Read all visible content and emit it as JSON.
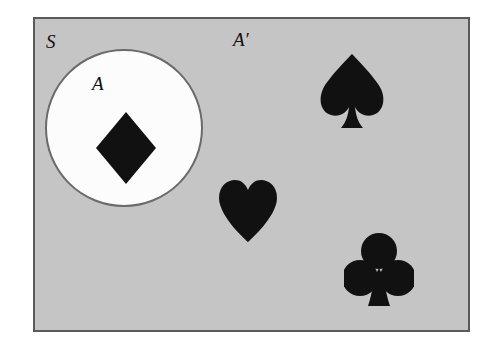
{
  "figure": {
    "type": "venn-diagram",
    "title_visible": false,
    "colors": {
      "page_background": "#ffffff",
      "universe_fill": "#c5c5c5",
      "universe_border": "#5a5a5a",
      "set_a_fill": "#fcfcfc",
      "set_a_border": "#6a6a6a",
      "suit_fill": "#111111",
      "label_color": "#111111"
    },
    "labels": [
      {
        "id": "universe",
        "text": "S",
        "name": "universal-set"
      },
      {
        "id": "set-a",
        "text": "A",
        "name": "set-a"
      },
      {
        "id": "complement",
        "text": "A′",
        "name": "set-a-complement"
      }
    ],
    "regions": [
      {
        "name": "universal-set-S",
        "label": "S",
        "shape": "rectangle",
        "fill": "gray",
        "members": [
          "diamond",
          "spade",
          "heart",
          "club"
        ]
      },
      {
        "name": "set-A",
        "label": "A",
        "shape": "circle",
        "fill": "white",
        "members": [
          "diamond"
        ]
      },
      {
        "name": "complement-A-prime",
        "label": "A′",
        "shape": "region outside circle",
        "fill": "gray",
        "members": [
          "spade",
          "heart",
          "club"
        ]
      }
    ],
    "elements": [
      {
        "name": "diamond-suit",
        "icon": "diamond-icon",
        "glyph": "♦",
        "region": "A"
      },
      {
        "name": "spade-suit",
        "icon": "spade-icon",
        "glyph": "♠",
        "region": "A′"
      },
      {
        "name": "heart-suit",
        "icon": "heart-icon",
        "glyph": "♥",
        "region": "A′"
      },
      {
        "name": "club-suit",
        "icon": "club-icon",
        "glyph": "♣",
        "region": "A′"
      }
    ]
  }
}
